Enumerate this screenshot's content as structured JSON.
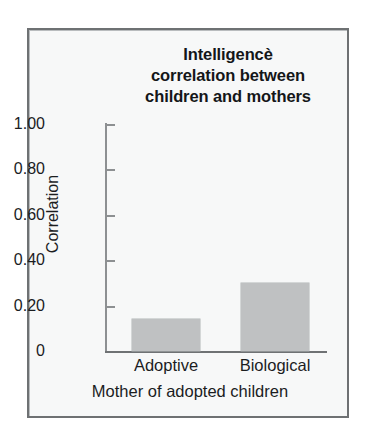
{
  "figure": {
    "frame_color": "#6e7173",
    "background_color": "#f7f8f8",
    "bar_color": "#bfc1c2"
  },
  "chart_data": {
    "type": "bar",
    "title": "Intelligencè correlation between children and mothers",
    "title_lines": [
      "Intelligencè",
      "correlation between",
      "children and mothers"
    ],
    "categories": [
      "Adoptive",
      "Biological"
    ],
    "values": [
      0.14,
      0.3
    ],
    "xlabel": "Mother of adopted children",
    "ylabel": "Correlation",
    "ylim": [
      0,
      1.0
    ],
    "yticks": [
      0,
      0.2,
      0.4,
      0.6,
      0.8,
      1.0
    ],
    "ytick_labels": [
      "0",
      "0.20",
      "0.40",
      "0.60",
      "0.80",
      "1.00"
    ],
    "grid": false,
    "legend": false
  }
}
